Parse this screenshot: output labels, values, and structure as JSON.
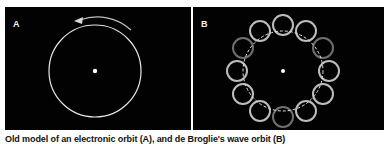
{
  "figure": {
    "panels": [
      {
        "id": "A",
        "label": "A",
        "description": "Circular electron orbit with rotation arrow"
      },
      {
        "id": "B",
        "label": "B",
        "description": "Standing wave orbit drawn as ring of overlapping circles around dashed orbit"
      }
    ],
    "caption": "Old model of an electronic orbit (A), and de Broglie's wave orbit (B)",
    "colors": {
      "background": "#020202",
      "orbit": "#e6e6e6",
      "wave_light": "#bdbdbd",
      "wave_dark": "#6b6b6b",
      "nucleus": "#ffffff"
    }
  }
}
